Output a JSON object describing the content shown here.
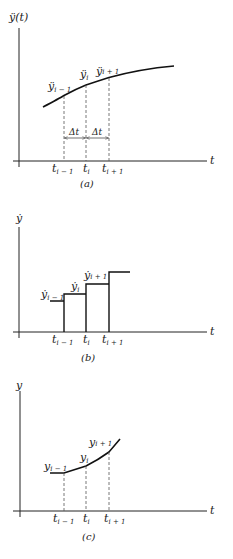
{
  "panels": [
    {
      "id": "a",
      "caption": "(a)",
      "y_axis_label": "ÿ(t)",
      "x_axis_label": "t",
      "description": "Acceleration curve with sample points",
      "tick_labels": [
        {
          "base": "t",
          "sub": "i − 1"
        },
        {
          "base": "t",
          "sub": "i"
        },
        {
          "base": "t",
          "sub": "i + 1"
        }
      ],
      "point_labels": [
        {
          "base": "ÿ",
          "sub": "i − 1"
        },
        {
          "base": "ÿ",
          "sub": "i"
        },
        {
          "base": "ÿ",
          "sub": "i + 1"
        }
      ],
      "interval_labels": [
        "Δt",
        "Δt"
      ]
    },
    {
      "id": "b",
      "caption": "(b)",
      "y_axis_label": "ẏ",
      "x_axis_label": "t",
      "description": "Piecewise-constant velocity steps",
      "tick_labels": [
        {
          "base": "t",
          "sub": "i − 1"
        },
        {
          "base": "t",
          "sub": "i"
        },
        {
          "base": "t",
          "sub": "i + 1"
        }
      ],
      "point_labels": [
        {
          "base": "ẏ",
          "sub": "i − 1"
        },
        {
          "base": "ẏ",
          "sub": "i"
        },
        {
          "base": "ẏ",
          "sub": "i + 1"
        }
      ]
    },
    {
      "id": "c",
      "caption": "(c)",
      "y_axis_label": "y",
      "x_axis_label": "t",
      "description": "Piecewise-linear displacement",
      "tick_labels": [
        {
          "base": "t",
          "sub": "i − 1"
        },
        {
          "base": "t",
          "sub": "i"
        },
        {
          "base": "t",
          "sub": "i + 1"
        }
      ],
      "point_labels": [
        {
          "base": "y",
          "sub": "i − 1"
        },
        {
          "base": "y",
          "sub": "i"
        },
        {
          "base": "y",
          "sub": "i + 1"
        }
      ]
    }
  ]
}
